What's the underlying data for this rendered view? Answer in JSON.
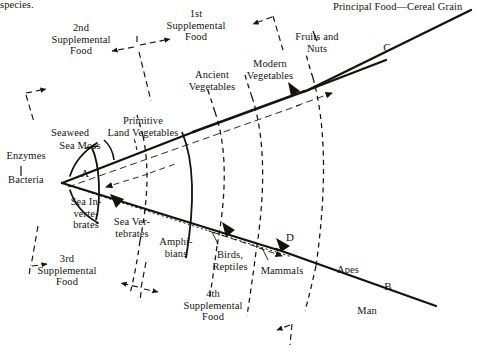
{
  "figure": {
    "type": "conceptual-diagram",
    "page_text_fragment": "species."
  },
  "labels": {
    "fragment_top_left": "species.",
    "supplemental_1": "1st\nSupplemental\nFood",
    "supplemental_2": "2nd\nSupplemental\nFood",
    "supplemental_3": "3rd\nSupplemental\nFood",
    "supplemental_4": "4th\nSupplemental\nFood",
    "enzymes": "Enzymes",
    "bacteria": "Bacteria",
    "seaweed": "Seaweed",
    "sea_moss": "Sea Moss",
    "primitive_land_vegetables": "Primitive\nLand Vegetables",
    "ancient_vegetables": "Ancient\nVegetables",
    "modern_vegetables": "Modern\nVegetables",
    "fruits_and_nuts": "Fruits and\nNuts",
    "principal_food": "Principal Food—Cereal Grain",
    "sea_invertebrates": "Sea In-\nverte-\nbrates",
    "sea_vertebrates": "Sea Ver-\ntebrates",
    "amphibians": "Amphi-\nbians",
    "birds_reptiles": "Birds,\nReptiles",
    "mammals": "Mammals",
    "apes": "Apes",
    "man": "Man"
  },
  "keys": {
    "a": "A",
    "b": "B",
    "c": "C",
    "d": "D"
  },
  "colors": {
    "ink": "#15120f",
    "line": "#1a1a1a",
    "background": "#ffffff"
  }
}
